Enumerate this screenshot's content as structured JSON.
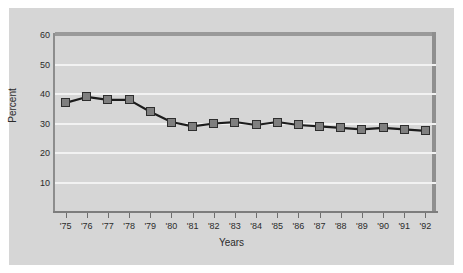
{
  "chart_data": {
    "type": "line",
    "title": "",
    "xlabel": "Years",
    "ylabel": "Percent",
    "categories": [
      "'75",
      "'76",
      "'77",
      "'78",
      "'79",
      "'80",
      "'81",
      "'82",
      "'83",
      "'84",
      "'85",
      "'86",
      "'87",
      "'88",
      "'89",
      "'90",
      "'91",
      "'92"
    ],
    "values": [
      37,
      39,
      38,
      38,
      34,
      30.5,
      29,
      30,
      30.5,
      29.5,
      30.5,
      29.5,
      29,
      28.5,
      28,
      28.5,
      28,
      27.5
    ],
    "ylim": [
      0,
      60
    ],
    "yticks": [
      10,
      20,
      30,
      40,
      50,
      60
    ],
    "ytick_labels": [
      "10",
      "20",
      "30",
      "40",
      "50",
      "60"
    ],
    "grid": true,
    "legend": "none",
    "series_color": "#7f7f7f",
    "line_color": "#1c1c1c",
    "plot_background": "#d6d6d6",
    "gridline_color": "#f2f2f2",
    "axis_color": "#8d8d8d"
  }
}
